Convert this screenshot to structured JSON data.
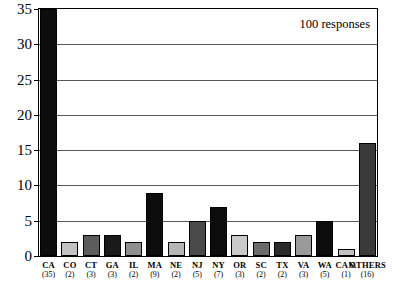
{
  "chart_data": {
    "type": "bar",
    "title": "",
    "xlabel": "",
    "ylabel": "",
    "ylim": [
      0,
      35
    ],
    "grid": true,
    "legend": "none",
    "annotation": "100 responses",
    "y_ticks": [
      0,
      5,
      10,
      15,
      20,
      25,
      30,
      35
    ],
    "y_tick_labels": [
      "0",
      "5",
      "10",
      "15",
      "20",
      "25",
      "30",
      "35"
    ],
    "categories": [
      "CA",
      "CO",
      "CT",
      "GA",
      "IL",
      "MA",
      "NE",
      "NJ",
      "NY",
      "OR",
      "SC",
      "TX",
      "VA",
      "WA",
      "CAN.",
      "OTHERS"
    ],
    "category_counts": [
      "(35)",
      "(2)",
      "(3)",
      "(3)",
      "(2)",
      "(9)",
      "(2)",
      "(5)",
      "(7)",
      "(3)",
      "(2)",
      "(2)",
      "(3)",
      "(5)",
      "(1)",
      "(16)"
    ],
    "values": [
      35,
      2,
      3,
      3,
      2,
      9,
      2,
      5,
      7,
      3,
      2,
      2,
      3,
      5,
      1,
      16
    ],
    "bar_colors": [
      "#0d0d0d",
      "#c2c2c2",
      "#5c5c5c",
      "#1a1a1a",
      "#8f8f8f",
      "#0d0d0d",
      "#b5b5b5",
      "#4a4a4a",
      "#0d0d0d",
      "#c9c9c9",
      "#6b6b6b",
      "#2b2b2b",
      "#9a9a9a",
      "#0d0d0d",
      "#c2c2c2",
      "#3a3a3a"
    ]
  }
}
